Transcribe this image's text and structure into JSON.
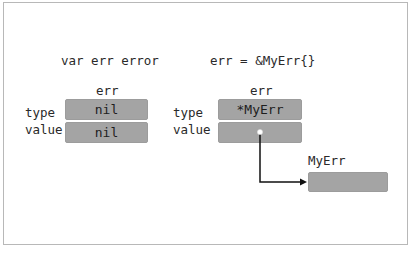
{
  "left": {
    "code": "var err error",
    "var_label": "err",
    "rows": [
      {
        "label": "type",
        "value": "nil"
      },
      {
        "label": "value",
        "value": "nil"
      }
    ]
  },
  "right": {
    "code": "err = &MyErr{}",
    "var_label": "err",
    "rows": [
      {
        "label": "type",
        "value": "*MyErr"
      },
      {
        "label": "value",
        "value": ""
      }
    ],
    "target_label": "MyErr",
    "target_value": ""
  },
  "colors": {
    "box_fill": "#a4a4a4",
    "arrow": "#111111",
    "frame": "#b8b8b8"
  }
}
